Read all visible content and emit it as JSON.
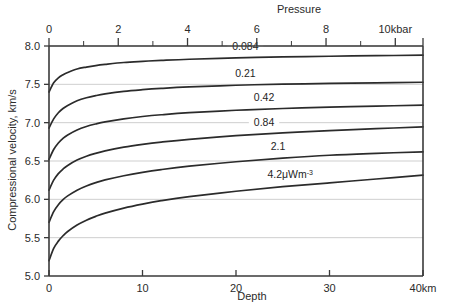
{
  "chart_data": {
    "type": "line",
    "title": "",
    "xlabel": "Depth",
    "ylabel": "Compressional velocity, km/s",
    "x_top_label": "Pressure",
    "xlim": [
      0,
      40
    ],
    "ylim": [
      5.0,
      8.0
    ],
    "xlim_top": [
      0,
      10.8
    ],
    "grid": true,
    "legend_position": "inline-curve-labels",
    "x_ticks": [
      {
        "value": 0,
        "label": "0"
      },
      {
        "value": 10,
        "label": "10"
      },
      {
        "value": 20,
        "label": "20"
      },
      {
        "value": 30,
        "label": "30"
      },
      {
        "value": 40,
        "label": "40km"
      }
    ],
    "x_top_ticks": [
      {
        "value": 0,
        "label": "0",
        "major": true
      },
      {
        "value": 1,
        "label": "",
        "major": false
      },
      {
        "value": 2,
        "label": "2",
        "major": true
      },
      {
        "value": 3,
        "label": "",
        "major": false
      },
      {
        "value": 4,
        "label": "4",
        "major": true
      },
      {
        "value": 5,
        "label": "",
        "major": false
      },
      {
        "value": 6,
        "label": "6",
        "major": true
      },
      {
        "value": 7,
        "label": "",
        "major": false
      },
      {
        "value": 8,
        "label": "8",
        "major": true
      },
      {
        "value": 9,
        "label": "",
        "major": false
      },
      {
        "value": 10,
        "label": "10kbar",
        "major": true
      }
    ],
    "y_ticks": [
      {
        "value": 5.0,
        "label": "5.0"
      },
      {
        "value": 5.5,
        "label": "5.5"
      },
      {
        "value": 6.0,
        "label": "6.0"
      },
      {
        "value": 6.5,
        "label": "6.5"
      },
      {
        "value": 7.0,
        "label": "7.0"
      },
      {
        "value": 7.5,
        "label": "7.5"
      },
      {
        "value": 8.0,
        "label": "8.0"
      }
    ],
    "series": [
      {
        "name": "0.084",
        "label": "0.084",
        "label_x": 21.0,
        "label_y_offset": 0.105,
        "x": [
          0,
          0.5,
          1,
          1.5,
          2,
          3,
          4,
          5,
          6,
          8,
          10,
          12,
          15,
          20,
          25,
          30,
          35,
          40
        ],
        "y": [
          7.4,
          7.52,
          7.585,
          7.625,
          7.655,
          7.7,
          7.725,
          7.745,
          7.76,
          7.785,
          7.8,
          7.812,
          7.827,
          7.845,
          7.857,
          7.866,
          7.874,
          7.88
        ]
      },
      {
        "name": "0.21",
        "label": "0.21",
        "label_x": 21.0,
        "label_y_offset": 0.105,
        "x": [
          0,
          0.5,
          1,
          1.5,
          2,
          3,
          4,
          5,
          6,
          8,
          10,
          12,
          15,
          20,
          25,
          30,
          35,
          40
        ],
        "y": [
          6.93,
          7.05,
          7.13,
          7.185,
          7.225,
          7.285,
          7.325,
          7.353,
          7.375,
          7.408,
          7.43,
          7.447,
          7.466,
          7.488,
          7.502,
          7.512,
          7.52,
          7.527
        ]
      },
      {
        "name": "0.42",
        "label": "0.42",
        "label_x": 23.0,
        "label_y_offset": 0.105,
        "x": [
          0,
          0.5,
          1,
          1.5,
          2,
          3,
          4,
          5,
          6,
          8,
          10,
          12,
          15,
          20,
          25,
          30,
          35,
          40
        ],
        "y": [
          6.52,
          6.65,
          6.735,
          6.795,
          6.84,
          6.905,
          6.95,
          6.983,
          7.01,
          7.05,
          7.08,
          7.103,
          7.13,
          7.162,
          7.185,
          7.202,
          7.216,
          7.228
        ]
      },
      {
        "name": "0.84",
        "label": "0.84",
        "label_x": 23.0,
        "label_y_offset": 0.105,
        "x": [
          0,
          0.5,
          1,
          1.5,
          2,
          3,
          4,
          5,
          6,
          8,
          10,
          12,
          15,
          20,
          25,
          30,
          35,
          40
        ],
        "y": [
          6.12,
          6.25,
          6.335,
          6.395,
          6.442,
          6.512,
          6.562,
          6.6,
          6.632,
          6.68,
          6.717,
          6.747,
          6.783,
          6.83,
          6.866,
          6.896,
          6.922,
          6.945
        ]
      },
      {
        "name": "2.1",
        "label": "2.1",
        "label_x": 24.5,
        "label_y_offset": 0.105,
        "x": [
          0,
          0.5,
          1,
          1.5,
          2,
          3,
          4,
          5,
          6,
          8,
          10,
          12,
          15,
          20,
          25,
          30,
          35,
          40
        ],
        "y": [
          5.7,
          5.84,
          5.93,
          5.995,
          6.045,
          6.12,
          6.175,
          6.218,
          6.253,
          6.308,
          6.352,
          6.388,
          6.432,
          6.49,
          6.537,
          6.575,
          6.6,
          6.62
        ]
      },
      {
        "name": "4.2",
        "label": "4.2μWm",
        "label_sup": "-3",
        "label_x": 25.8,
        "label_y_offset": 0.105,
        "x": [
          0,
          0.5,
          1,
          1.5,
          2,
          3,
          4,
          5,
          6,
          8,
          10,
          12,
          15,
          20,
          25,
          30,
          35,
          40
        ],
        "y": [
          5.2,
          5.36,
          5.455,
          5.525,
          5.58,
          5.665,
          5.728,
          5.778,
          5.82,
          5.886,
          5.938,
          5.982,
          6.035,
          6.105,
          6.165,
          6.215,
          6.265,
          6.315
        ]
      }
    ]
  }
}
